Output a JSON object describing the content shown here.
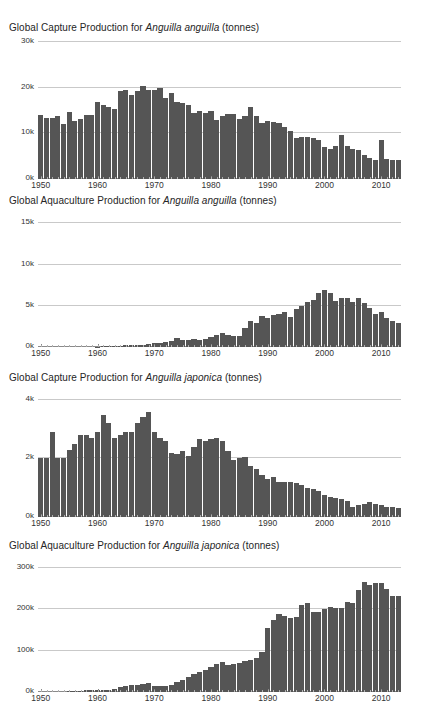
{
  "figure": {
    "background": "#ffffff",
    "bar_color": "#555555",
    "grid_color": "#c9c9c9",
    "axis_color": "#8a8a8a"
  },
  "chart_data": [
    {
      "type": "bar",
      "id": "capture-anguilla-anguilla",
      "title": "Global Capture Production for Anguilla anguilla (tonnes)",
      "title_prefix": "Global Capture Production for ",
      "title_species": "Anguilla anguilla",
      "title_suffix": " (tonnes)",
      "xlabel": "",
      "ylabel": "",
      "ylim": [
        0,
        30000
      ],
      "yticks": [
        0,
        10000,
        20000,
        30000
      ],
      "yticklabels": [
        "0k",
        "10k",
        "20k",
        "30k"
      ],
      "xlim": [
        1950,
        2013
      ],
      "xticks": [
        1950,
        1960,
        1970,
        1980,
        1990,
        2000,
        2010
      ],
      "xticklabels": [
        "1950",
        "1960",
        "1970",
        "1980",
        "1990",
        "2000",
        "2010"
      ],
      "grid": true,
      "legend": "none",
      "x": [
        1950,
        1951,
        1952,
        1953,
        1954,
        1955,
        1956,
        1957,
        1958,
        1959,
        1960,
        1961,
        1962,
        1963,
        1964,
        1965,
        1966,
        1967,
        1968,
        1969,
        1970,
        1971,
        1972,
        1973,
        1974,
        1975,
        1976,
        1977,
        1978,
        1979,
        1980,
        1981,
        1982,
        1983,
        1984,
        1985,
        1986,
        1987,
        1988,
        1989,
        1990,
        1991,
        1992,
        1993,
        1994,
        1995,
        1996,
        1997,
        1998,
        1999,
        2000,
        2001,
        2002,
        2003,
        2004,
        2005,
        2006,
        2007,
        2008,
        2009,
        2010,
        2011,
        2012,
        2013
      ],
      "values": [
        14100,
        13300,
        13300,
        13700,
        12000,
        14600,
        12800,
        13200,
        14000,
        14000,
        16900,
        16200,
        15700,
        15300,
        19200,
        19500,
        18500,
        19300,
        20400,
        19600,
        19400,
        19900,
        17700,
        18900,
        16900,
        16600,
        16200,
        14400,
        15000,
        14500,
        14800,
        13000,
        13800,
        14200,
        14200,
        13100,
        13900,
        15800,
        13800,
        12200,
        12700,
        12400,
        12200,
        11300,
        10500,
        9000,
        9100,
        9200,
        9000,
        8600,
        7000,
        6600,
        7300,
        9700,
        7200,
        6600,
        6300,
        5200,
        4500,
        4200,
        8600,
        4300,
        4200,
        4200
      ]
    },
    {
      "type": "bar",
      "id": "aquaculture-anguilla-anguilla",
      "title": "Global Aquaculture Production for Anguilla anguilla (tonnes)",
      "title_prefix": "Global Aquaculture Production for ",
      "title_species": "Anguilla anguilla",
      "title_suffix": " (tonnes)",
      "xlabel": "",
      "ylabel": "",
      "ylim": [
        0,
        16000
      ],
      "yticks": [
        0,
        5000,
        10000,
        15000
      ],
      "yticklabels": [
        "0k",
        "5k",
        "10k",
        "15k"
      ],
      "xlim": [
        1950,
        2013
      ],
      "xticks": [
        1950,
        1960,
        1970,
        1980,
        1990,
        2000,
        2010
      ],
      "xticklabels": [
        "1950",
        "1960",
        "1970",
        "1980",
        "1990",
        "2000",
        "2010"
      ],
      "grid": true,
      "legend": "none",
      "x": [
        1950,
        1951,
        1952,
        1953,
        1954,
        1955,
        1956,
        1957,
        1958,
        1959,
        1960,
        1961,
        1962,
        1963,
        1964,
        1965,
        1966,
        1967,
        1968,
        1969,
        1970,
        1971,
        1972,
        1973,
        1974,
        1975,
        1976,
        1977,
        1978,
        1979,
        1980,
        1981,
        1982,
        1983,
        1984,
        1985,
        1986,
        1987,
        1988,
        1989,
        1990,
        1991,
        1992,
        1993,
        1994,
        1995,
        1996,
        1997,
        1998,
        1999,
        2000,
        2001,
        2002,
        2003,
        2004,
        2005,
        2006,
        2007,
        2008,
        2009,
        2010,
        2011,
        2012,
        2013
      ],
      "values": [
        0,
        0,
        0,
        0,
        0,
        0,
        0,
        0,
        0,
        0,
        60,
        80,
        100,
        140,
        170,
        200,
        220,
        230,
        300,
        360,
        430,
        480,
        550,
        700,
        1100,
        800,
        900,
        950,
        900,
        1000,
        1250,
        1450,
        1650,
        1400,
        1300,
        1350,
        2300,
        3100,
        2900,
        3800,
        3500,
        3900,
        4000,
        4300,
        3600,
        4600,
        5000,
        5400,
        5700,
        6500,
        6900,
        6600,
        5600,
        5900,
        5900,
        5500,
        5900,
        5300,
        4700,
        4000,
        4200,
        3500,
        3200,
        2900
      ]
    },
    {
      "type": "bar",
      "id": "capture-anguilla-japonica",
      "title": "Global Capture Production for Anguilla japonica (tonnes)",
      "title_prefix": "Global Capture Production for ",
      "title_species": "Anguilla japonica",
      "title_suffix": " (tonnes)",
      "xlabel": "",
      "ylabel": "",
      "ylim": [
        0,
        4200
      ],
      "yticks": [
        0,
        2000,
        4000
      ],
      "yticklabels": [
        "0k",
        "2k",
        "4k"
      ],
      "xlim": [
        1950,
        2013
      ],
      "xticks": [
        1950,
        1960,
        1970,
        1980,
        1990,
        2000,
        2010
      ],
      "xticklabels": [
        "1950",
        "1960",
        "1970",
        "1980",
        "1990",
        "2000",
        "2010"
      ],
      "grid": true,
      "legend": "none",
      "x": [
        1950,
        1951,
        1952,
        1953,
        1954,
        1955,
        1956,
        1957,
        1958,
        1959,
        1960,
        1961,
        1962,
        1963,
        1964,
        1965,
        1966,
        1967,
        1968,
        1969,
        1970,
        1971,
        1972,
        1973,
        1974,
        1975,
        1976,
        1977,
        1978,
        1979,
        1980,
        1981,
        1982,
        1983,
        1984,
        1985,
        1986,
        1987,
        1988,
        1989,
        1990,
        1991,
        1992,
        1993,
        1994,
        1995,
        1996,
        1997,
        1998,
        1999,
        2000,
        2001,
        2002,
        2003,
        2004,
        2005,
        2006,
        2007,
        2008,
        2009,
        2010,
        2011,
        2012,
        2013
      ],
      "values": [
        2000,
        2000,
        2900,
        2000,
        2000,
        2300,
        2500,
        2800,
        2800,
        2700,
        2900,
        3500,
        3200,
        2700,
        2800,
        2900,
        2900,
        3200,
        3400,
        3600,
        2900,
        2700,
        2600,
        2200,
        2150,
        2250,
        2100,
        2400,
        2650,
        2600,
        2650,
        2700,
        2600,
        2250,
        1950,
        2000,
        2050,
        1750,
        1650,
        1450,
        1300,
        1350,
        1200,
        1200,
        1200,
        1150,
        1100,
        1000,
        950,
        900,
        750,
        700,
        650,
        600,
        550,
        350,
        400,
        450,
        500,
        450,
        400,
        350,
        330,
        320
      ]
    },
    {
      "type": "bar",
      "id": "aquaculture-anguilla-japonica",
      "title": "Global Aquaculture Production for Anguilla japonica (tonnes)",
      "title_prefix": "Global Aquaculture Production for ",
      "title_species": "Anguilla japonica",
      "title_suffix": " (tonnes)",
      "xlabel": "",
      "ylabel": "",
      "ylim": [
        0,
        310000
      ],
      "yticks": [
        0,
        100000,
        200000,
        300000
      ],
      "yticklabels": [
        "0k",
        "100k",
        "200k",
        "300k"
      ],
      "xlim": [
        1950,
        2013
      ],
      "xticks": [
        1950,
        1960,
        1970,
        1980,
        1990,
        2000,
        2010
      ],
      "xticklabels": [
        "1950",
        "1960",
        "1970",
        "1980",
        "1990",
        "2000",
        "2010"
      ],
      "grid": true,
      "legend": "none",
      "x": [
        1950,
        1951,
        1952,
        1953,
        1954,
        1955,
        1956,
        1957,
        1958,
        1959,
        1960,
        1961,
        1962,
        1963,
        1964,
        1965,
        1966,
        1967,
        1968,
        1969,
        1970,
        1971,
        1972,
        1973,
        1974,
        1975,
        1976,
        1977,
        1978,
        1979,
        1980,
        1981,
        1982,
        1983,
        1984,
        1985,
        1986,
        1987,
        1988,
        1989,
        1990,
        1991,
        1992,
        1993,
        1994,
        1995,
        1996,
        1997,
        1998,
        1999,
        2000,
        2001,
        2002,
        2003,
        2004,
        2005,
        2006,
        2007,
        2008,
        2009,
        2010,
        2011,
        2012,
        2013
      ],
      "values": [
        0,
        0,
        0,
        0,
        0,
        2000,
        3000,
        3500,
        4000,
        4500,
        5000,
        5500,
        6000,
        8000,
        13000,
        15000,
        16000,
        18000,
        19000,
        21000,
        15000,
        14000,
        15000,
        18000,
        24000,
        30000,
        36000,
        43000,
        48000,
        54000,
        60000,
        67000,
        72000,
        66000,
        68000,
        70000,
        76000,
        78000,
        82000,
        98000,
        155000,
        175000,
        188000,
        183000,
        180000,
        182000,
        210000,
        215000,
        194000,
        193000,
        202000,
        205000,
        204000,
        203000,
        218000,
        216000,
        248000,
        267000,
        259000,
        265000,
        264000,
        249000,
        232000,
        232000
      ]
    }
  ]
}
